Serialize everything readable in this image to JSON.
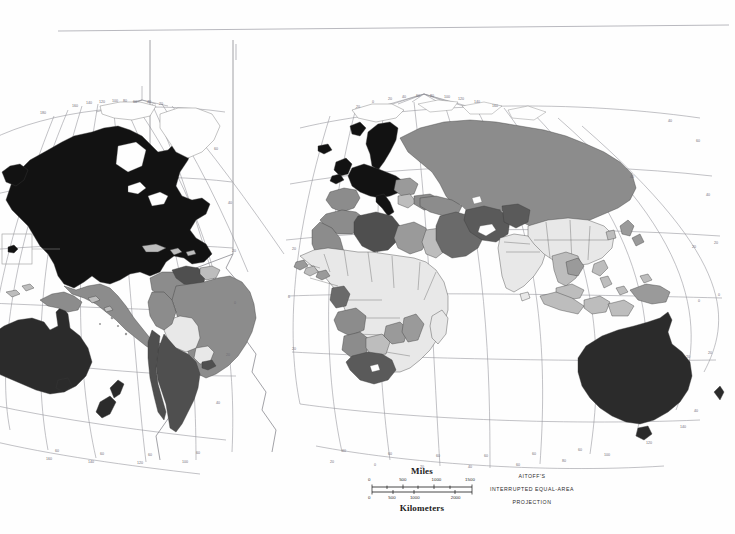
{
  "map": {
    "title": "World Map",
    "projection": {
      "line1": "AITOFF'S",
      "line2": "INTERRUPTED  EQUAL-AREA",
      "line3": "PROJECTION"
    },
    "scale": {
      "miles_label": "Miles",
      "kilometers_label": "Kilometers",
      "miles_ticks": [
        "0",
        "500",
        "1000",
        "1500"
      ],
      "km_ticks": [
        "0",
        "500",
        "1000",
        "2000"
      ]
    },
    "graticule": {
      "latitude_labels": [
        "80",
        "60",
        "40",
        "20",
        "0",
        "20",
        "40",
        "60"
      ],
      "longitude_labels": [
        "160",
        "140",
        "120",
        "100",
        "80",
        "60",
        "40",
        "20",
        "0",
        "20",
        "40",
        "60",
        "80",
        "100",
        "120",
        "140",
        "160",
        "180"
      ],
      "interval_degrees": 20
    },
    "legend_classes": [
      {
        "name": "highest",
        "color": "#121212"
      },
      {
        "name": "high",
        "color": "#4f4f4f"
      },
      {
        "name": "medium",
        "color": "#8c8c8c"
      },
      {
        "name": "low",
        "color": "#bdbdbd"
      },
      {
        "name": "lowest",
        "color": "#e8e8e8"
      },
      {
        "name": "no-data",
        "color": "#ffffff"
      }
    ],
    "shading": {
      "united_states": "highest",
      "canada": "highest",
      "mexico": "medium",
      "greenland": "no-data",
      "brazil": "medium",
      "colombia": "medium",
      "venezuela": "high",
      "argentina": "high",
      "chile": "high",
      "bolivia": "lowest",
      "paraguay": "lowest",
      "peru": "medium",
      "western_europe": "highest",
      "scandinavia": "highest",
      "united_kingdom": "highest",
      "iceland": "highest",
      "russia": "medium",
      "eastern_europe": "medium",
      "turkey": "medium",
      "libya": "high",
      "algeria": "medium",
      "egypt": "medium",
      "saudi_arabia": "high",
      "iran": "high",
      "iraq": "high",
      "sub_saharan_africa": "lowest",
      "south_africa": "high",
      "angola": "medium",
      "gabon": "high",
      "namibia": "medium",
      "india": "lowest",
      "china": "lowest",
      "southeast_asia": "low",
      "indonesia": "low",
      "japan": "lowest",
      "australia": "highest",
      "new_zealand": "highest",
      "papua_new_guinea": "medium"
    },
    "inset": {
      "name": "hawaii-inset",
      "shading": "highest"
    },
    "interruptions": [
      "central-pacific-lobe",
      "atlantic-lobe"
    ]
  }
}
